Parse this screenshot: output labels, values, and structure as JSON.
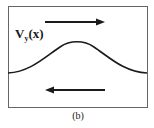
{
  "figure": {
    "curve_label_main": "V",
    "curve_label_sub": "y",
    "curve_label_arg": "(x)",
    "caption": "(b)",
    "top_arrow_direction": "right",
    "bottom_arrow_direction": "left",
    "stroke_color": "#1a1a1a",
    "frame_color": "#555555"
  }
}
